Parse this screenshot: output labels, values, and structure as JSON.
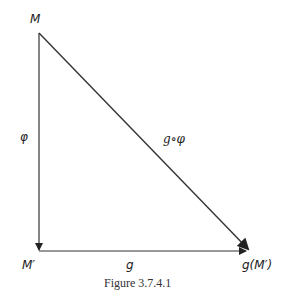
{
  "diagram": {
    "nodes": {
      "M": "M",
      "M_prime": "M′",
      "g_M_prime": "g(M′)"
    },
    "edges": {
      "phi": "φ",
      "g": "g",
      "g_compose_phi": "g∘φ"
    },
    "caption": "Figure 3.7.4.1"
  }
}
